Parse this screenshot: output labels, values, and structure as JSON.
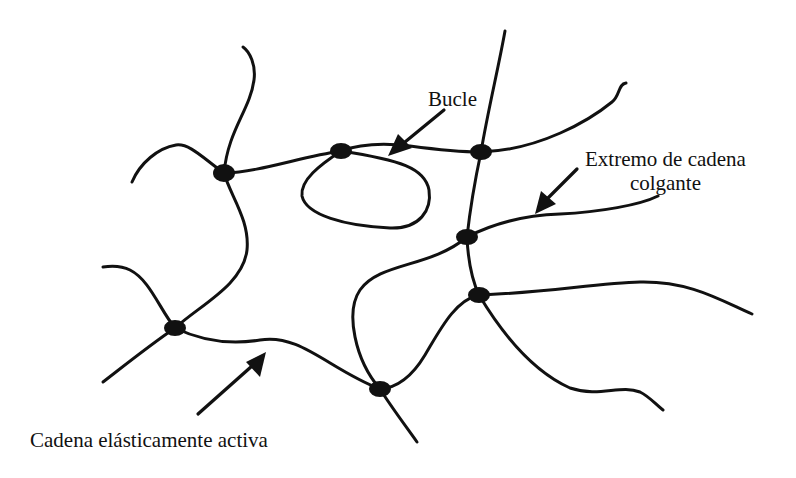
{
  "diagram": {
    "type": "polymer-network",
    "colors": {
      "ink": "#111111",
      "background": "#ffffff"
    },
    "labels": {
      "loop": "Bucle",
      "dangling_end_line1": "Extremo de cadena",
      "dangling_end_line2": "colgante",
      "elastic_chain": "Cadena elásticamente activa"
    },
    "crosslinks": [
      {
        "id": "A",
        "x": 224,
        "y": 173
      },
      {
        "id": "B",
        "x": 341,
        "y": 151
      },
      {
        "id": "C",
        "x": 481,
        "y": 152
      },
      {
        "id": "D",
        "x": 467,
        "y": 237
      },
      {
        "id": "E",
        "x": 479,
        "y": 295
      },
      {
        "id": "F",
        "x": 175,
        "y": 328
      },
      {
        "id": "G",
        "x": 380,
        "y": 389
      }
    ],
    "annotations": [
      {
        "label": "Bucle",
        "points_to": "loop at B"
      },
      {
        "label": "Extremo de cadena colgante",
        "points_to": "dangling chain end from D"
      },
      {
        "label": "Cadena elásticamente activa",
        "points_to": "chain F–G"
      }
    ]
  }
}
